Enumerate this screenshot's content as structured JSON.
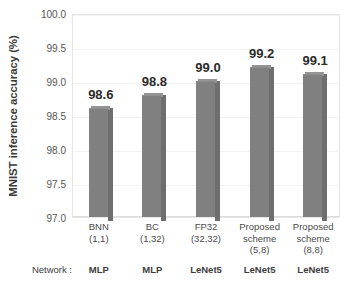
{
  "chart_data": {
    "type": "bar",
    "title": "",
    "xlabel": "",
    "ylabel": "MNIST inference accuracy (%)",
    "ylim": [
      97.0,
      100.0
    ],
    "ytick_labels": [
      "100.0",
      "99.5",
      "99.0",
      "98.5",
      "98.0",
      "97.5",
      "97.0"
    ],
    "ytick_values": [
      100.0,
      99.5,
      99.0,
      98.5,
      98.0,
      97.5,
      97.0
    ],
    "grid": true,
    "legend": "none",
    "bar_color": "#808080",
    "categories": [
      {
        "line1": "BNN",
        "line2": "(1,1)",
        "line3": "",
        "network": "MLP"
      },
      {
        "line1": "BC",
        "line2": "(1,32)",
        "line3": "",
        "network": "MLP"
      },
      {
        "line1": "FP32",
        "line2": "(32,32)",
        "line3": "",
        "network": "LeNet5"
      },
      {
        "line1": "Proposed",
        "line2": "scheme",
        "line3": "(5,8)",
        "network": "LeNet5"
      },
      {
        "line1": "Proposed",
        "line2": "scheme",
        "line3": "(8,8)",
        "network": "LeNet5"
      }
    ],
    "values": [
      98.6,
      98.8,
      99.0,
      99.2,
      99.1
    ],
    "value_labels": [
      "98.6",
      "98.8",
      "99.0",
      "99.2",
      "99.1"
    ],
    "network_row_label": "Network :"
  }
}
